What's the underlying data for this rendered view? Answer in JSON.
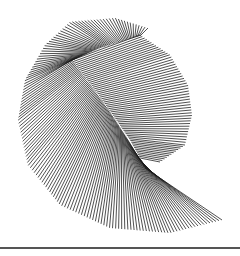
{
  "figure": {
    "background": "#ffffff",
    "line_color": "#1a1a1a",
    "line_width": 0.9,
    "line_opacity": 0.85,
    "fans": [
      {
        "name": "main-fan",
        "count": 150,
        "inner": [
          [
            145,
            168
          ],
          [
            140,
            160
          ],
          [
            128,
            140
          ],
          [
            110,
            112
          ],
          [
            90,
            84
          ],
          [
            72,
            60
          ],
          [
            100,
            48
          ],
          [
            140,
            36
          ]
        ],
        "outer": [
          [
            222,
            220
          ],
          [
            170,
            233
          ],
          [
            110,
            228
          ],
          [
            60,
            205
          ],
          [
            28,
            165
          ],
          [
            18,
            120
          ],
          [
            25,
            80
          ],
          [
            45,
            45
          ],
          [
            70,
            22
          ],
          [
            115,
            18
          ],
          [
            148,
            28
          ]
        ]
      },
      {
        "name": "upper-right-fan",
        "count": 60,
        "inner": [
          [
            72,
            60
          ],
          [
            95,
            90
          ],
          [
            115,
            118
          ],
          [
            130,
            140
          ],
          [
            140,
            158
          ]
        ],
        "outer": [
          [
            140,
            35
          ],
          [
            170,
            55
          ],
          [
            188,
            85
          ],
          [
            192,
            115
          ],
          [
            185,
            145
          ],
          [
            160,
            162
          ]
        ]
      }
    ]
  },
  "rule": {
    "y": 247,
    "color": "#555555"
  }
}
